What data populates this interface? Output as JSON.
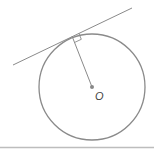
{
  "diagram": {
    "center_label": "O",
    "colors": {
      "stroke": "#8a8a8a",
      "center_dot": "#888888",
      "rule": "#bdbdbd",
      "label": "#444444"
    },
    "elements": [
      "circle",
      "tangent-line",
      "radius",
      "right-angle-marker",
      "center-point"
    ]
  }
}
